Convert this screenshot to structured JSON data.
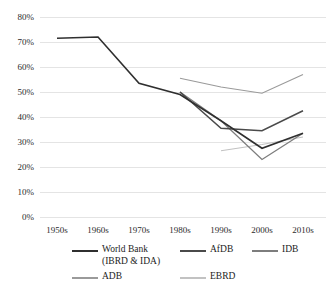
{
  "chart_data": {
    "type": "line",
    "title": "",
    "xlabel": "",
    "ylabel": "",
    "categories": [
      "1950s",
      "1960s",
      "1970s",
      "1980s",
      "1990s",
      "2000s",
      "2010s"
    ],
    "ylim": [
      0,
      80
    ],
    "ytick_labels": [
      "0%",
      "10%",
      "20%",
      "30%",
      "40%",
      "50%",
      "60%",
      "70%",
      "80%"
    ],
    "ytick_values": [
      0,
      10,
      20,
      30,
      40,
      50,
      60,
      70,
      80
    ],
    "grid": true,
    "legend_position": "bottom",
    "series": [
      {
        "name": "World Bank (IBRD & IDA)",
        "color": "#2f2f2f",
        "x": [
          "1950s",
          "1960s",
          "1970s",
          "1980s",
          "1990s",
          "2000s",
          "2010s"
        ],
        "values": [
          71.5,
          72.0,
          53.5,
          49.0,
          38.5,
          27.5,
          33.5
        ]
      },
      {
        "name": "AfDB",
        "color": "#4a4a4a",
        "x": [
          "1980s",
          "1990s",
          "2000s",
          "2010s"
        ],
        "values": [
          50.0,
          35.5,
          34.5,
          42.5
        ]
      },
      {
        "name": "IDB",
        "color": "#7d7d7d",
        "x": [
          "1980s",
          "1990s",
          "2000s",
          "2010s"
        ],
        "values": [
          50.0,
          38.5,
          23.0,
          33.5
        ]
      },
      {
        "name": "ADB",
        "color": "#9a9a9a",
        "x": [
          "1980s",
          "1990s",
          "2000s",
          "2010s"
        ],
        "values": [
          55.5,
          52.0,
          49.5,
          57.0
        ]
      },
      {
        "name": "EBRD",
        "color": "#c2c2c2",
        "x": [
          "1990s",
          "2000s",
          "2010s"
        ],
        "values": [
          26.5,
          29.0,
          32.0
        ]
      }
    ]
  },
  "legend": {
    "entries": [
      {
        "label_line1": "World Bank",
        "label_line2": "(IBRD & IDA)",
        "color": "#2f2f2f"
      },
      {
        "label_line1": "AfDB",
        "label_line2": "",
        "color": "#4a4a4a"
      },
      {
        "label_line1": "IDB",
        "label_line2": "",
        "color": "#7d7d7d"
      },
      {
        "label_line1": "ADB",
        "label_line2": "",
        "color": "#9a9a9a"
      },
      {
        "label_line1": "EBRD",
        "label_line2": "",
        "color": "#c2c2c2"
      }
    ]
  },
  "axis": {
    "y_labels": [
      "80%",
      "70%",
      "60%",
      "50%",
      "40%",
      "30%",
      "20%",
      "10%",
      "0%"
    ],
    "x_labels": [
      "1950s",
      "1960s",
      "1970s",
      "1980s",
      "1990s",
      "2000s",
      "2010s"
    ]
  }
}
